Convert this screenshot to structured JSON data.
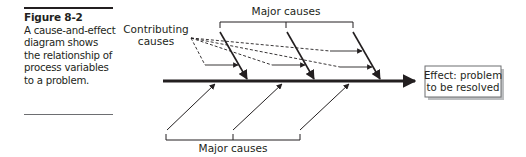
{
  "caption": {
    "title": "Figure 8-2",
    "body": "A cause-and-effect diagram shows the relationship of process variables to a problem."
  },
  "diagram": {
    "type": "fishbone",
    "labels": {
      "top_major": "Major causes",
      "bottom_major": "Major causes",
      "contributing_line1": "Contributing",
      "contributing_line2": "causes",
      "effect_line1": "Effect: problem",
      "effect_line2": "to be resolved"
    },
    "colors": {
      "ink": "#231f20",
      "box_border": "#6d6e71",
      "box_shadow": "#bcbec0"
    },
    "top_major_cause_count": 3,
    "bottom_major_cause_count": 3,
    "contributing_cause_count": 4
  }
}
